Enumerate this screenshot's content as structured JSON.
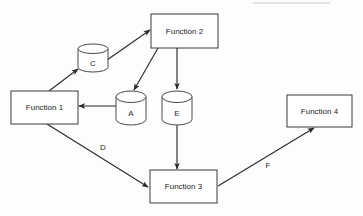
{
  "diagram": {
    "type": "data-flow-diagram",
    "background_color": "#fdfdfd",
    "line_color": "#2b2b2b",
    "nodes": [
      {
        "id": "function-1",
        "shape": "rectangle",
        "label": "Function 1",
        "x": 11,
        "y": 91,
        "w": 67,
        "h": 33,
        "cx": 44.5,
        "cy": 107.5
      },
      {
        "id": "function-2",
        "shape": "rectangle",
        "label": "Function 2",
        "x": 151,
        "y": 14,
        "w": 67,
        "h": 34,
        "cx": 184.5,
        "cy": 31
      },
      {
        "id": "function-3",
        "shape": "rectangle",
        "label": "Function 3",
        "x": 150,
        "y": 170,
        "w": 67,
        "h": 33,
        "cx": 183.5,
        "cy": 186.5
      },
      {
        "id": "function-4",
        "shape": "rectangle",
        "label": "Function 4",
        "x": 287,
        "y": 95,
        "w": 65,
        "h": 32,
        "cx": 319.5,
        "cy": 111
      }
    ],
    "stores": [
      {
        "id": "store-c",
        "shape": "cylinder",
        "label": "C",
        "x": 78,
        "y": 44,
        "w": 30,
        "h": 28,
        "cx": 93,
        "cy": 61
      },
      {
        "id": "store-a",
        "shape": "cylinder",
        "label": "A",
        "x": 116,
        "y": 91,
        "w": 30,
        "h": 34,
        "cx": 131,
        "cy": 111
      },
      {
        "id": "store-e",
        "shape": "cylinder",
        "label": "E",
        "x": 162,
        "y": 91,
        "w": 30,
        "h": 34,
        "cx": 177,
        "cy": 111
      }
    ],
    "edges": [
      {
        "id": "edge-f1-to-c",
        "from": "function-1",
        "to": "store-c",
        "label": "",
        "path": "M 49,91 L 78,69",
        "arrow_at": "end"
      },
      {
        "id": "edge-c-to-f2",
        "from": "store-c",
        "to": "function-2",
        "label": "",
        "path": "M 107,60 L 150,30",
        "arrow_at": "end"
      },
      {
        "id": "edge-f2-to-a",
        "from": "function-2",
        "to": "store-a",
        "label": "",
        "path": "M 158,48 L 134,90",
        "arrow_at": "end"
      },
      {
        "id": "edge-a-to-f1",
        "from": "store-a",
        "to": "function-1",
        "label": "",
        "path": "M 116,106 L 79,106",
        "arrow_at": "end"
      },
      {
        "id": "edge-f2-to-e",
        "from": "function-2",
        "to": "store-e",
        "label": "",
        "path": "M 177,48 L 177,89",
        "arrow_at": "end"
      },
      {
        "id": "edge-e-to-f3",
        "from": "store-e",
        "to": "function-3",
        "label": "",
        "path": "M 177,125 L 177,169",
        "arrow_at": "end"
      },
      {
        "id": "edge-f1-to-f3",
        "from": "function-1",
        "to": "function-3",
        "label": "D",
        "label_x": 103,
        "label_y": 147,
        "path": "M 47,124 L 148,187",
        "arrow_at": "end"
      },
      {
        "id": "edge-f3-to-f4",
        "from": "function-3",
        "to": "function-4",
        "label": "F",
        "label_x": 268,
        "label_y": 165,
        "path": "M 218,186 L 314,128",
        "arrow_at": "end"
      }
    ]
  }
}
